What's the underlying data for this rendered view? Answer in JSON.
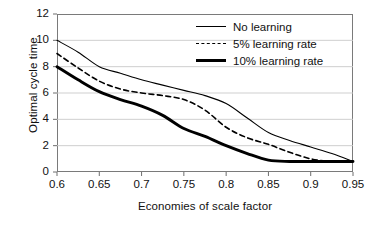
{
  "chart_data": {
    "type": "line",
    "title": "",
    "xlabel": "Economies of scale factor",
    "ylabel": "Optimal cycle time",
    "xlim": [
      0.6,
      0.95
    ],
    "ylim": [
      0,
      12
    ],
    "xticks": [
      "0.6",
      "0.65",
      "0.7",
      "0.75",
      "0.8",
      "0.85",
      "0.9",
      "0.95"
    ],
    "yticks": [
      "0",
      "2",
      "4",
      "6",
      "8",
      "10",
      "12"
    ],
    "grid": "horizontal",
    "legend_position": "top-right",
    "x": [
      0.6,
      0.625,
      0.65,
      0.675,
      0.7,
      0.725,
      0.75,
      0.775,
      0.8,
      0.825,
      0.85,
      0.875,
      0.9,
      0.925,
      0.95
    ],
    "series": [
      {
        "name": "No learning",
        "style": "solid-thin",
        "values": [
          10.0,
          9.1,
          8.0,
          7.5,
          7.0,
          6.6,
          6.2,
          5.8,
          5.2,
          4.1,
          3.0,
          2.4,
          1.9,
          1.4,
          0.8
        ]
      },
      {
        "name": "5% learning rate",
        "style": "dashed",
        "values": [
          9.0,
          7.9,
          6.9,
          6.3,
          6.0,
          5.8,
          5.5,
          4.7,
          3.4,
          2.6,
          2.1,
          1.5,
          1.0,
          0.8,
          0.8
        ]
      },
      {
        "name": "10% learning rate",
        "style": "solid-thick",
        "values": [
          8.0,
          7.0,
          6.1,
          5.5,
          5.0,
          4.3,
          3.3,
          2.7,
          2.0,
          1.4,
          0.9,
          0.8,
          0.8,
          0.8,
          0.8
        ]
      }
    ]
  },
  "legend": {
    "items": [
      {
        "label": "No learning"
      },
      {
        "label": "5% learning rate"
      },
      {
        "label": "10% learning rate"
      }
    ]
  }
}
